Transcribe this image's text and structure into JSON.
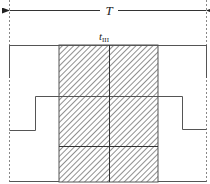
{
  "diagram": {
    "period_label": "T",
    "interval_label": {
      "symbol": "t",
      "subscript": "III"
    },
    "colors": {
      "line": "#555555",
      "hatch": "#444444",
      "background": "#ffffff"
    },
    "regions": [
      {
        "name": "hatched-interval",
        "pattern": "diagonal-hatch"
      }
    ]
  }
}
